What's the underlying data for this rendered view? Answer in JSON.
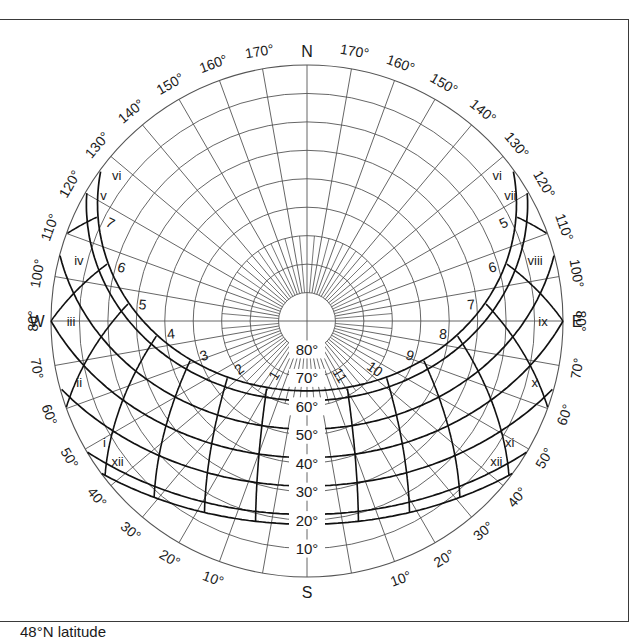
{
  "caption": "48°N latitude",
  "diagram": {
    "type": "sun-path",
    "latitude_deg": 48,
    "center": [
      307,
      321
    ],
    "radius": 256,
    "cardinal_labels": {
      "north": "N",
      "south": "S",
      "east": "E",
      "west": "W"
    },
    "azimuth_labels_north_half": [
      "170°",
      "160°",
      "150°",
      "140°",
      "130°",
      "120°",
      "110°",
      "100°"
    ],
    "azimuth_labels_south_half": [
      "80°",
      "70°",
      "60°",
      "50°",
      "40°",
      "30°",
      "20°",
      "10°"
    ],
    "altitude_labels": [
      "10°",
      "20°",
      "30°",
      "40°",
      "50°",
      "60°",
      "70°",
      "80°"
    ],
    "month_curves": [
      {
        "left_label": "vi",
        "right_label": "vi",
        "declination": 23.45
      },
      {
        "left_label": "v",
        "right_label": "vii",
        "declination": 20.0
      },
      {
        "left_label": "iv",
        "right_label": "viii",
        "declination": 10.0
      },
      {
        "left_label": "iii",
        "right_label": "ix",
        "declination": 0.0
      },
      {
        "left_label": "ii",
        "right_label": "x",
        "declination": -10.0
      },
      {
        "left_label": "i",
        "right_label": "xi",
        "declination": -20.0
      },
      {
        "left_label": "xii",
        "right_label": "xii",
        "declination": -23.45
      }
    ],
    "hour_lines": [
      {
        "label": "1",
        "hour_angle": 15
      },
      {
        "label": "2",
        "hour_angle": 30
      },
      {
        "label": "3",
        "hour_angle": 45
      },
      {
        "label": "4",
        "hour_angle": 60
      },
      {
        "label": "5",
        "hour_angle": 75
      },
      {
        "label": "6",
        "hour_angle": 90
      },
      {
        "label": "7",
        "hour_angle": 105
      },
      {
        "label": "11",
        "hour_angle": -15
      },
      {
        "label": "10",
        "hour_angle": -30
      },
      {
        "label": "9",
        "hour_angle": -45
      },
      {
        "label": "8",
        "hour_angle": -60
      },
      {
        "label": "7",
        "hour_angle": -75
      },
      {
        "label": "6",
        "hour_angle": -90
      },
      {
        "label": "5",
        "hour_angle": -105
      }
    ],
    "colors": {
      "grid": "#555555",
      "curves": "#111111",
      "text": "#1a1a1a"
    }
  }
}
